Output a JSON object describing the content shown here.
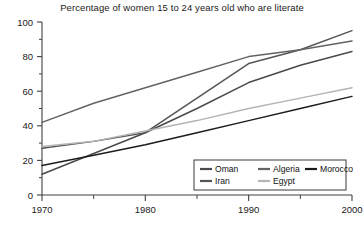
{
  "chart_data": {
    "type": "line",
    "title": "Percentage of women 15 to 24 years old who are literate",
    "xlabel": "",
    "ylabel": "",
    "xlim": [
      1970,
      2000
    ],
    "ylim": [
      0,
      100
    ],
    "grid": false,
    "legend_position": "bottom-right",
    "x_ticks": [
      "1970",
      "1980",
      "1990",
      "2000"
    ],
    "x_tick_values": [
      1970,
      1980,
      1990,
      2000
    ],
    "x_minor_ticks": [
      1975,
      1985,
      1995
    ],
    "y_ticks": [
      "0",
      "20",
      "40",
      "60",
      "80",
      "100"
    ],
    "y_tick_values": [
      0,
      20,
      40,
      60,
      80,
      100
    ],
    "y_minor_ticks": [
      10,
      30,
      50,
      70,
      90
    ],
    "x": [
      1970,
      1975,
      1980,
      1985,
      1990,
      1995,
      2000
    ],
    "series": [
      {
        "name": "Oman",
        "color": "#4a4a4a",
        "values": [
          12,
          24,
          36,
          50,
          65,
          75,
          83
        ]
      },
      {
        "name": "Iran",
        "color": "#555555",
        "values": [
          27,
          31,
          36,
          56,
          76,
          84,
          95
        ]
      },
      {
        "name": "Algeria",
        "color": "#636363",
        "values": [
          42,
          53,
          62,
          71,
          80,
          84,
          89
        ]
      },
      {
        "name": "Egypt",
        "color": "#b4b4b4",
        "values": [
          28,
          31,
          37,
          43,
          50,
          56,
          62
        ]
      },
      {
        "name": "Morocco",
        "color": "#1c1c1c",
        "values": [
          17,
          23,
          29,
          36,
          43,
          50,
          57
        ]
      }
    ]
  },
  "legend": {
    "rows": [
      [
        "Oman",
        "Algeria",
        "Morocco"
      ],
      [
        "Iran",
        "Egypt"
      ]
    ]
  },
  "axis": {
    "line_color": "#404040"
  }
}
